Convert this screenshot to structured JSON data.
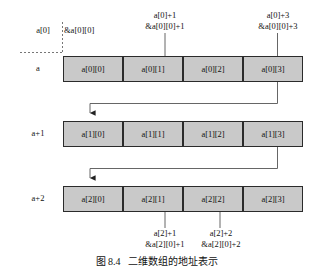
{
  "figure": {
    "caption_number": "图 8.4",
    "caption_text": "二维数组的地址表示"
  },
  "colors": {
    "cell_fill": "#c9c9c9",
    "cell_border": "#2b2b2b",
    "line": "#555555",
    "dashed": "#777777",
    "text": "#111111",
    "background": "#ffffff"
  },
  "top_labels": {
    "left_base": "a[0]",
    "base_address": "&a[0][0]",
    "col1": {
      "line1": "a[0]+1",
      "line2": "&a[0][0]+1"
    },
    "col3": {
      "line1": "a[0]+3",
      "line2": "&a[0][0]+3"
    }
  },
  "rows": [
    {
      "label": "a",
      "cells": [
        "a[0][0]",
        "a[0][1]",
        "a[0][2]",
        "a[0][3]"
      ]
    },
    {
      "label": "a+1",
      "cells": [
        "a[1][0]",
        "a[1][1]",
        "a[1][2]",
        "a[1][3]"
      ]
    },
    {
      "label": "a+2",
      "cells": [
        "a[2][0]",
        "a[2][1]",
        "a[2][2]",
        "a[2][3]"
      ]
    }
  ],
  "bottom_labels": {
    "col1": {
      "line1": "a[2]+1",
      "line2": "&a[2][0]+1"
    },
    "col2": {
      "line1": "a[2]+2",
      "line2": "&a[2][0]+2"
    }
  }
}
